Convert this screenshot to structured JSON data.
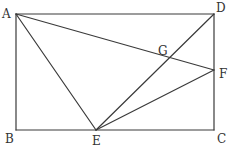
{
  "diagram": {
    "type": "geometry",
    "shape": "rectangle ABCD with interior segments",
    "points": {
      "A": {
        "label": "A",
        "x": 16,
        "y": 14,
        "lx": 2,
        "ly": 18
      },
      "B": {
        "label": "B",
        "x": 16,
        "y": 130,
        "lx": 5,
        "ly": 143
      },
      "C": {
        "label": "C",
        "x": 214,
        "y": 130,
        "lx": 217,
        "ly": 143
      },
      "D": {
        "label": "D",
        "x": 214,
        "y": 14,
        "lx": 216,
        "ly": 12
      },
      "E": {
        "label": "E",
        "x": 96,
        "y": 130,
        "lx": 92,
        "ly": 145
      },
      "F": {
        "label": "F",
        "x": 214,
        "y": 70,
        "lx": 219,
        "ly": 78
      },
      "G": {
        "label": "G",
        "x": 168,
        "y": 59,
        "lx": 158,
        "ly": 55
      }
    },
    "segments": [
      [
        "A",
        "D"
      ],
      [
        "D",
        "C"
      ],
      [
        "C",
        "B"
      ],
      [
        "B",
        "A"
      ],
      [
        "A",
        "E"
      ],
      [
        "A",
        "F"
      ],
      [
        "E",
        "D"
      ],
      [
        "E",
        "F"
      ]
    ],
    "stroke_color": "#3a3a3a",
    "label_color": "#333333"
  }
}
